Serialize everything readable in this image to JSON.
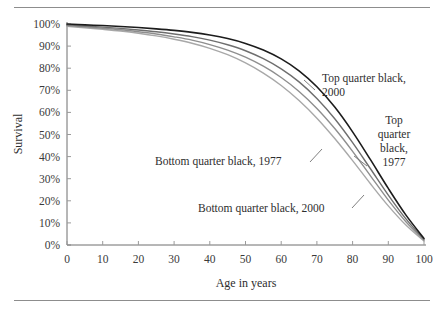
{
  "figure": {
    "background": "#ffffff",
    "rule_color": "#8d8d8d",
    "axis_color": "#6f6f6f"
  },
  "chart_data": {
    "type": "line",
    "title": "",
    "xlabel": "Age in years",
    "ylabel": "Survival",
    "xlim": [
      0,
      100
    ],
    "ylim": [
      0,
      100
    ],
    "grid": false,
    "legend_position": "inline-annotations",
    "x_ticks": [
      0,
      10,
      20,
      30,
      40,
      50,
      60,
      70,
      80,
      90,
      100
    ],
    "x_tick_labels": [
      "0",
      "10",
      "20",
      "30",
      "40",
      "50",
      "60",
      "70",
      "80",
      "90",
      "100"
    ],
    "y_ticks": [
      0,
      10,
      20,
      30,
      40,
      50,
      60,
      70,
      80,
      90,
      100
    ],
    "y_tick_labels": [
      "0%",
      "10%",
      "20%",
      "30%",
      "40%",
      "50%",
      "60%",
      "70%",
      "80%",
      "90%",
      "100%"
    ],
    "x": [
      0,
      5,
      10,
      15,
      20,
      25,
      30,
      35,
      40,
      45,
      50,
      55,
      60,
      65,
      70,
      75,
      80,
      85,
      90,
      95,
      100
    ],
    "series": [
      {
        "name": "Top quarter black, 2000",
        "color": "#1c1c1c",
        "width": 1.6,
        "values": [
          100.0,
          99.6,
          99.3,
          98.9,
          98.4,
          97.8,
          97.1,
          96.2,
          95.0,
          93.4,
          91.2,
          88.2,
          84.2,
          78.8,
          71.6,
          62.4,
          51.2,
          38.6,
          25.6,
          13.4,
          3.0
        ]
      },
      {
        "name": "Top quarter black, 1977",
        "color": "#6e6e6e",
        "width": 1.4,
        "values": [
          99.6,
          99.1,
          98.6,
          98.0,
          97.3,
          96.5,
          95.5,
          94.3,
          92.7,
          90.6,
          87.9,
          84.3,
          79.7,
          73.8,
          66.3,
          57.1,
          46.3,
          34.5,
          22.6,
          11.7,
          2.6
        ]
      },
      {
        "name": "Bottom quarter black, 1977",
        "color": "#8e8e8e",
        "width": 1.4,
        "values": [
          99.3,
          98.7,
          98.1,
          97.4,
          96.5,
          95.5,
          94.2,
          92.7,
          90.7,
          88.2,
          85.0,
          80.9,
          75.8,
          69.5,
          61.8,
          52.7,
          42.4,
          31.3,
          20.3,
          10.4,
          2.2
        ]
      },
      {
        "name": "Bottom quarter black, 2000",
        "color": "#a8a8a8",
        "width": 1.4,
        "values": [
          99.0,
          98.3,
          97.6,
          96.8,
          95.8,
          94.6,
          93.1,
          91.3,
          89.0,
          86.1,
          82.4,
          77.8,
          72.2,
          65.4,
          57.4,
          48.2,
          38.2,
          27.7,
          17.7,
          8.9,
          1.8
        ]
      }
    ],
    "annotations": [
      {
        "id": "top-quarter-2000",
        "lines": [
          "Top quarter black,",
          "2000"
        ],
        "align": "left",
        "text_x": 322,
        "text_y": 82,
        "leader": {
          "x1": 315,
          "y1": 90,
          "x2": 304,
          "y2": 80
        }
      },
      {
        "id": "top-quarter-1977",
        "lines": [
          "Top",
          "quarter",
          "black,",
          "1977"
        ],
        "align": "center",
        "text_x": 394,
        "text_y": 124,
        "leader": {
          "x1": 367,
          "y1": 166,
          "x2": 354,
          "y2": 156
        }
      },
      {
        "id": "bottom-quarter-1977",
        "lines": [
          "Bottom quarter black, 1977"
        ],
        "align": "left",
        "text_x": 155,
        "text_y": 165,
        "leader": {
          "x1": 310,
          "y1": 162,
          "x2": 322,
          "y2": 149
        }
      },
      {
        "id": "bottom-quarter-2000",
        "lines": [
          "Bottom quarter black, 2000"
        ],
        "align": "left",
        "text_x": 198,
        "text_y": 212,
        "leader": {
          "x1": 352,
          "y1": 208,
          "x2": 364,
          "y2": 195
        }
      }
    ]
  }
}
